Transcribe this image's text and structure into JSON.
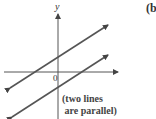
{
  "figure": {
    "part_label": "(b",
    "axis_y_label": "y",
    "origin_label": "0",
    "note_line1": "(two lines",
    "note_line2": " are parallel)"
  },
  "colors": {
    "line": "#555555",
    "axis": "#444444"
  }
}
